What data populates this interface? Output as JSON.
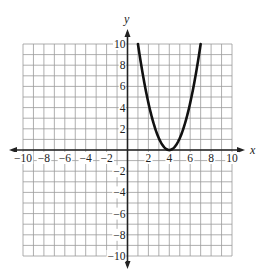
{
  "chart_data": {
    "type": "line",
    "title": "",
    "xlabel": "x",
    "ylabel": "y",
    "xlim": [
      -10,
      10
    ],
    "ylim": [
      -10,
      10
    ],
    "grid": true,
    "grid_step": 1,
    "x_ticks": [
      -10,
      -8,
      -6,
      -4,
      -2,
      2,
      4,
      6,
      8,
      10
    ],
    "y_ticks": [
      10,
      8,
      6,
      4,
      2,
      -2,
      -4,
      -6,
      -8,
      -10
    ],
    "x_tick_labels": [
      "−10",
      "−8",
      "−6",
      "−4",
      "−2",
      "2",
      "4",
      "6",
      "8",
      "10"
    ],
    "y_tick_labels": [
      "10",
      "8",
      "6",
      "4",
      "2",
      "−2",
      "−4",
      "−6",
      "−8",
      "−10"
    ],
    "series": [
      {
        "name": "parabola",
        "description": "Upward-opening parabola with vertex at (4, 0), passing through (1, 10) and (7, 10)",
        "equation": "y = (10/9)(x - 4)^2",
        "vertex": [
          4,
          0
        ],
        "x": [
          1,
          2,
          3,
          4,
          5,
          6,
          7
        ],
        "y": [
          10,
          4.44,
          1.11,
          0,
          1.11,
          4.44,
          10
        ],
        "color": "#111111"
      }
    ]
  },
  "colors": {
    "grid": "#9a9a9a",
    "axis": "#222222",
    "curve": "#111111"
  }
}
